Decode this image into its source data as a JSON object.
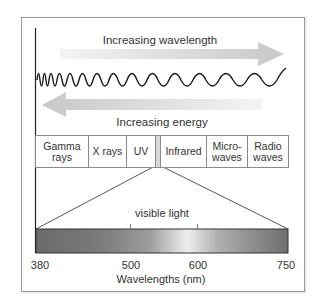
{
  "diagram": {
    "arrows": {
      "wavelength_label": "Increasing wavelength",
      "energy_label": "Increasing energy"
    },
    "bands": [
      {
        "line1": "Gamma",
        "line2": "rays",
        "width": 58
      },
      {
        "line1": "X rays",
        "line2": "",
        "width": 38
      },
      {
        "line1": "UV",
        "line2": "",
        "width": 28
      },
      {
        "line1": "",
        "line2": "",
        "width": 6,
        "visible": true
      },
      {
        "line1": "Infrared",
        "line2": "",
        "width": 44
      },
      {
        "line1": "Micro-",
        "line2": "waves",
        "width": 41
      },
      {
        "line1": "Radio",
        "line2": "waves",
        "width": 41
      }
    ],
    "visible_light": {
      "label": "visible light",
      "axis_label": "Wavelengths (nm)",
      "ticks": [
        "380",
        "500",
        "600",
        "750"
      ],
      "tick_values": [
        380,
        500,
        600,
        750
      ]
    },
    "colors": {
      "frame": "#9a9a9a",
      "wave": "#1a1a1a",
      "arrow": "#d6d6d6",
      "gradient_dark": "#6e6e6e",
      "gradient_light": "#eeeeee"
    }
  }
}
